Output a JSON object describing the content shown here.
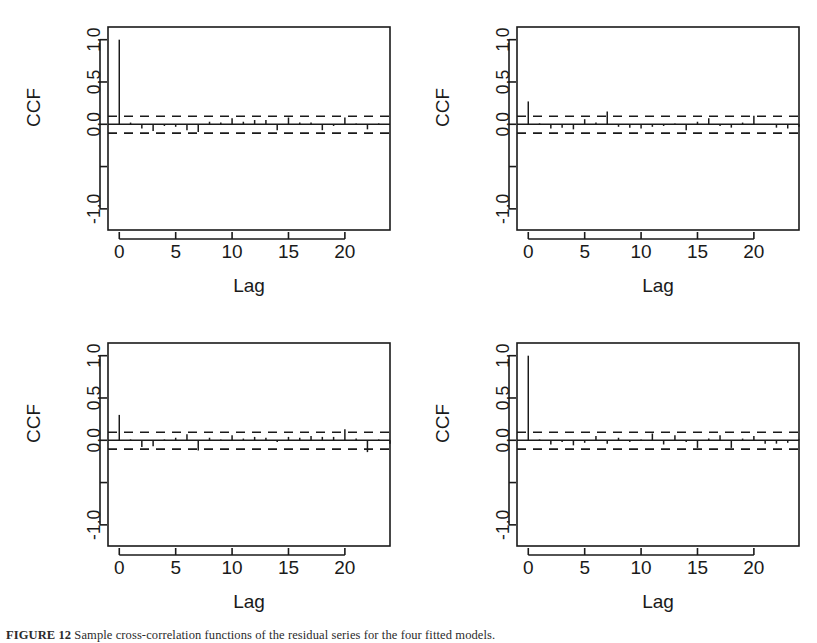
{
  "figure": {
    "background_color": "#ffffff",
    "ink_color": "#1a1a1a",
    "panel_count": 4,
    "caption_prefix": "FIGURE 12",
    "caption_rest": "  Sample cross-correlation functions of the residual series for the four fitted models."
  },
  "chart_data": [
    {
      "type": "bar",
      "subtype": "stick-correlogram",
      "title": "",
      "xlabel": "Lag",
      "ylabel": "CCF",
      "xlim": [
        -1,
        24
      ],
      "ylim": [
        -1.25,
        1.15
      ],
      "grid": false,
      "legend": null,
      "xticks": [
        0,
        5,
        10,
        15,
        20
      ],
      "xticklabels": [
        "0",
        "5",
        "10",
        "15",
        "20"
      ],
      "yticks": [
        -1.0,
        -0.5,
        0.0,
        0.5,
        1.0
      ],
      "yticklabels": [
        "-1.0",
        "",
        "0.0",
        "0.5",
        "1.0"
      ],
      "confidence_bounds": [
        0.095,
        -0.105
      ],
      "confidence_style": "dashed",
      "x": [
        0,
        1,
        2,
        3,
        4,
        5,
        6,
        7,
        8,
        9,
        10,
        11,
        12,
        13,
        14,
        15,
        16,
        17,
        18,
        19,
        20,
        21,
        22,
        23,
        24
      ],
      "values": [
        1.0,
        0.02,
        -0.05,
        -0.08,
        -0.02,
        -0.03,
        -0.07,
        -0.09,
        0.03,
        0.02,
        0.07,
        0.03,
        0.05,
        0.05,
        -0.07,
        0.08,
        0.02,
        0.02,
        -0.07,
        -0.02,
        0.08,
        0.01,
        -0.06,
        0.01,
        0.0
      ]
    },
    {
      "type": "bar",
      "subtype": "stick-correlogram",
      "title": "",
      "xlabel": "Lag",
      "ylabel": "CCF",
      "xlim": [
        -1,
        24
      ],
      "ylim": [
        -1.25,
        1.15
      ],
      "grid": false,
      "legend": null,
      "xticks": [
        0,
        5,
        10,
        15,
        20
      ],
      "xticklabels": [
        "0",
        "5",
        "10",
        "15",
        "20"
      ],
      "yticks": [
        -1.0,
        -0.5,
        0.0,
        0.5,
        1.0
      ],
      "yticklabels": [
        "-1.0",
        "",
        "0.0",
        "0.5",
        "1.0"
      ],
      "confidence_bounds": [
        0.095,
        -0.105
      ],
      "confidence_style": "dashed",
      "x": [
        0,
        1,
        2,
        3,
        4,
        5,
        6,
        7,
        8,
        9,
        10,
        11,
        12,
        13,
        14,
        15,
        16,
        17,
        18,
        19,
        20,
        21,
        22,
        23,
        24
      ],
      "values": [
        0.27,
        0.01,
        -0.05,
        -0.04,
        -0.06,
        0.06,
        0.02,
        0.15,
        -0.03,
        -0.04,
        -0.05,
        -0.03,
        -0.02,
        0.01,
        -0.07,
        0.03,
        0.07,
        -0.02,
        -0.04,
        0.02,
        0.1,
        -0.01,
        -0.04,
        -0.05,
        -0.03
      ]
    },
    {
      "type": "bar",
      "subtype": "stick-correlogram",
      "title": "",
      "xlabel": "Lag",
      "ylabel": "CCF",
      "xlim": [
        -1,
        24
      ],
      "ylim": [
        -1.25,
        1.15
      ],
      "grid": false,
      "legend": null,
      "xticks": [
        0,
        5,
        10,
        15,
        20
      ],
      "xticklabels": [
        "0",
        "5",
        "10",
        "15",
        "20"
      ],
      "yticks": [
        -1.0,
        -0.5,
        0.0,
        0.5,
        1.0
      ],
      "yticklabels": [
        "-1.0",
        "",
        "0.0",
        "0.5",
        "1.0"
      ],
      "confidence_bounds": [
        0.095,
        -0.105
      ],
      "confidence_style": "dashed",
      "x": [
        0,
        1,
        2,
        3,
        4,
        5,
        6,
        7,
        8,
        9,
        10,
        11,
        12,
        13,
        14,
        15,
        16,
        17,
        18,
        19,
        20,
        21,
        22,
        23,
        24
      ],
      "values": [
        0.3,
        0.01,
        -0.08,
        -0.07,
        0.01,
        0.03,
        0.07,
        -0.12,
        0.03,
        0.01,
        0.06,
        0.02,
        0.04,
        0.03,
        -0.02,
        0.04,
        0.03,
        0.05,
        0.04,
        0.04,
        0.13,
        0.02,
        -0.14,
        0.01,
        -0.04
      ]
    },
    {
      "type": "bar",
      "subtype": "stick-correlogram",
      "title": "",
      "xlabel": "Lag",
      "ylabel": "CCF",
      "xlim": [
        -1,
        24
      ],
      "ylim": [
        -1.25,
        1.15
      ],
      "grid": false,
      "legend": null,
      "xticks": [
        0,
        5,
        10,
        15,
        20
      ],
      "xticklabels": [
        "0",
        "5",
        "10",
        "15",
        "20"
      ],
      "yticks": [
        -1.0,
        -0.5,
        0.0,
        0.5,
        1.0
      ],
      "yticklabels": [
        "-1.0",
        "",
        "0.0",
        "0.5",
        "1.0"
      ],
      "confidence_bounds": [
        0.095,
        -0.105
      ],
      "confidence_style": "dashed",
      "x": [
        0,
        1,
        2,
        3,
        4,
        5,
        6,
        7,
        8,
        9,
        10,
        11,
        12,
        13,
        14,
        15,
        16,
        17,
        18,
        19,
        20,
        21,
        22,
        23,
        24
      ],
      "values": [
        1.0,
        0.01,
        -0.05,
        -0.02,
        -0.06,
        -0.03,
        0.05,
        -0.04,
        0.03,
        -0.02,
        0.01,
        0.08,
        -0.05,
        0.06,
        -0.02,
        -0.09,
        0.02,
        0.06,
        -0.09,
        0.02,
        0.05,
        -0.04,
        -0.04,
        -0.03,
        0.01
      ]
    }
  ],
  "panels": [
    {
      "name": "panel-top-left",
      "left": 0,
      "top": 0,
      "chart_index": 0
    },
    {
      "name": "panel-top-right",
      "left": 409,
      "top": 0,
      "chart_index": 1
    },
    {
      "name": "panel-bottom-left",
      "left": 0,
      "top": 316,
      "chart_index": 2
    },
    {
      "name": "panel-bottom-right",
      "left": 409,
      "top": 316,
      "chart_index": 3
    }
  ]
}
